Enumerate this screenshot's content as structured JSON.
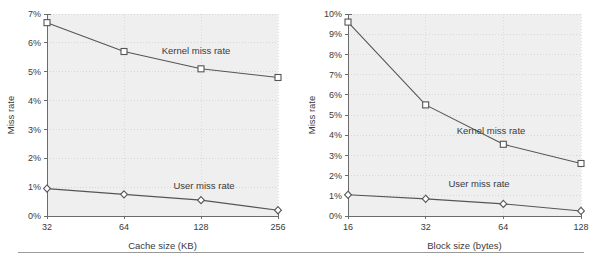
{
  "figure": {
    "name": "miss-rate-figure",
    "panels": 2,
    "footer_rule": true
  },
  "chart_data": [
    {
      "type": "line",
      "title": "",
      "xlabel": "Cache size (KB)",
      "ylabel": "Miss rate",
      "x": [
        32,
        64,
        128,
        256
      ],
      "xtick_labels": [
        "32",
        "64",
        "128",
        "256"
      ],
      "ytick_labels": [
        "0%",
        "1%",
        "2%",
        "3%",
        "4%",
        "5%",
        "6%",
        "7%"
      ],
      "ylim": [
        0,
        7
      ],
      "ytick_values": [
        0,
        1,
        2,
        3,
        4,
        5,
        6,
        7
      ],
      "grid": true,
      "legend_position": "inline-annotation",
      "series": [
        {
          "name": "Kernel miss rate",
          "marker": "square",
          "values": [
            6.7,
            5.7,
            5.1,
            4.8
          ]
        },
        {
          "name": "User miss rate",
          "marker": "diamond",
          "values": [
            0.95,
            0.75,
            0.55,
            0.2
          ]
        }
      ],
      "annotations": [
        "Kernel miss rate",
        "User miss rate"
      ]
    },
    {
      "type": "line",
      "title": "",
      "xlabel": "Block size (bytes)",
      "ylabel": "Miss rate",
      "x": [
        16,
        32,
        64,
        128
      ],
      "xtick_labels": [
        "16",
        "32",
        "64",
        "128"
      ],
      "ytick_labels": [
        "0%",
        "1%",
        "2%",
        "3%",
        "4%",
        "5%",
        "6%",
        "7%",
        "8%",
        "9%",
        "10%"
      ],
      "ylim": [
        0,
        10
      ],
      "ytick_values": [
        0,
        1,
        2,
        3,
        4,
        5,
        6,
        7,
        8,
        9,
        10
      ],
      "grid": true,
      "legend_position": "inline-annotation",
      "series": [
        {
          "name": "Kernel miss rate",
          "marker": "square",
          "values": [
            9.6,
            5.5,
            3.55,
            2.6
          ]
        },
        {
          "name": "User miss rate",
          "marker": "diamond",
          "values": [
            1.05,
            0.85,
            0.6,
            0.25
          ]
        }
      ],
      "annotations": [
        "Kernel miss rate",
        "User miss rate"
      ]
    }
  ],
  "colors": {
    "plot_background": "#efefef",
    "axis": "#6b6b6b",
    "gridline": "#cfcfcf",
    "series_stroke": "#555555",
    "marker_fill": "#ffffff",
    "text": "#3a3a3a",
    "rule": "#9a9a9a"
  }
}
